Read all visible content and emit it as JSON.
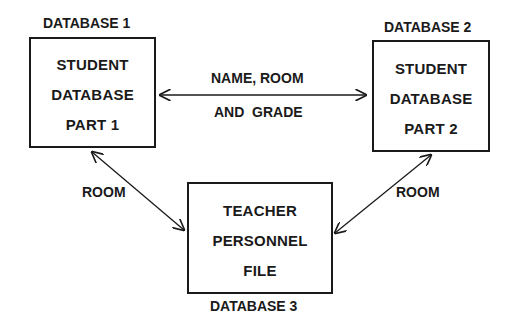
{
  "diagram": {
    "nodes": [
      {
        "id": "db1",
        "caption": "DATABASE 1",
        "lines": [
          "STUDENT",
          "DATABASE",
          "PART 1"
        ]
      },
      {
        "id": "db2",
        "caption": "DATABASE 2",
        "lines": [
          "STUDENT",
          "DATABASE",
          "PART 2"
        ]
      },
      {
        "id": "db3",
        "caption": "DATABASE 3",
        "lines": [
          "TEACHER",
          "PERSONNEL",
          "FILE"
        ]
      }
    ],
    "edges": [
      {
        "from": "db1",
        "to": "db2",
        "label_line1": "NAME, ROOM",
        "label_line2": "AND  GRADE",
        "bidirectional": true
      },
      {
        "from": "db1",
        "to": "db3",
        "label": "ROOM",
        "bidirectional": true
      },
      {
        "from": "db2",
        "to": "db3",
        "label": "ROOM",
        "bidirectional": true
      }
    ],
    "colors": {
      "stroke": "#1a1a1a",
      "background": "#ffffff"
    }
  }
}
